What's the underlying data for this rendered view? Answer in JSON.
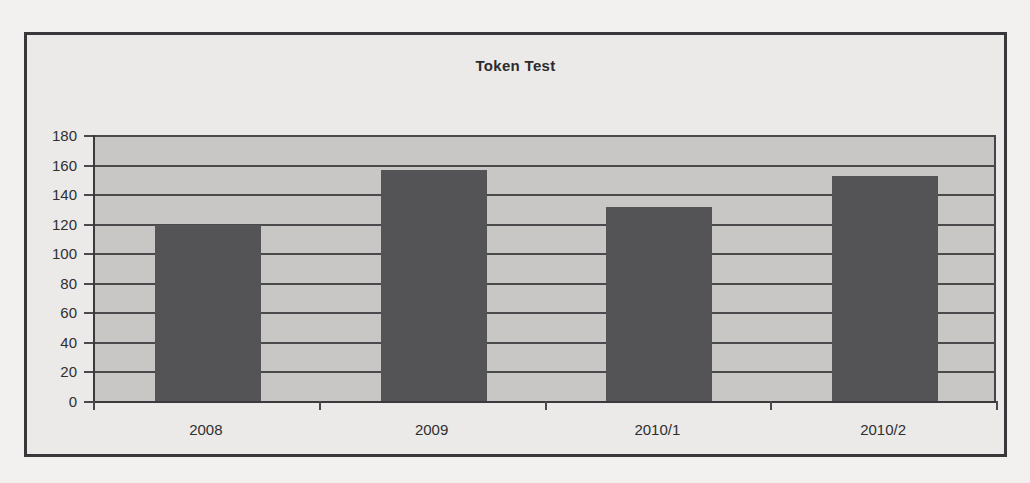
{
  "chart_data": {
    "type": "bar",
    "title": "Token Test",
    "xlabel": "",
    "ylabel": "",
    "categories": [
      "2008",
      "2009",
      "2010/1",
      "2010/2"
    ],
    "values": [
      119,
      156,
      131,
      152
    ],
    "series": [
      {
        "name": "Token Test",
        "values": [
          119,
          156,
          131,
          152
        ]
      }
    ],
    "ylim": [
      0,
      180
    ],
    "yticks": [
      0,
      20,
      40,
      60,
      80,
      100,
      120,
      140,
      160,
      180
    ],
    "ytick_labels": [
      "0",
      "20",
      "40",
      "60",
      "80",
      "100",
      "120",
      "140",
      "160",
      "180"
    ],
    "grid": true,
    "legend": false,
    "legend_position": "none",
    "colors": {
      "bar": "#545355",
      "plot_background": "#c8c7c5",
      "chart_background": "#ebeae8",
      "gridline": "#4a4a4c",
      "text": "#2f2f31",
      "frame_border": "#38383a"
    }
  }
}
